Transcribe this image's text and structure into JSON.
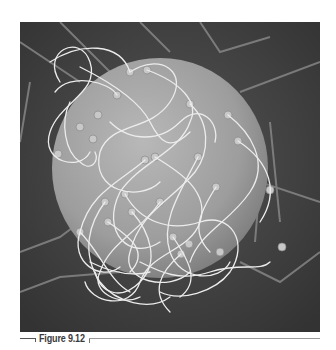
{
  "figure": {
    "label": "Figure 9.12",
    "image": {
      "subject": "scanning electron micrograph of sperm cells attached to an egg cell",
      "colors": {
        "background": "#4b4b4b",
        "sphere": "#a9a9a9",
        "filaments": "#e8e8e8"
      }
    }
  }
}
